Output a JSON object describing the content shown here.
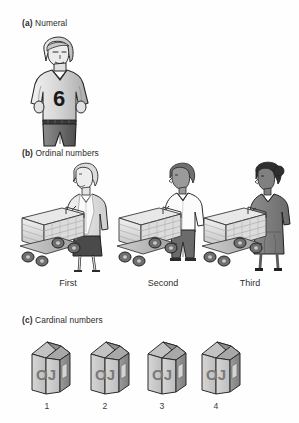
{
  "figure": {
    "background_color": "#ffffff",
    "ink_color": "#231f20"
  },
  "panels": [
    {
      "tag": "(a)",
      "label": "Numeral",
      "illustration": "soccer-player-wearing-numbered-jersey",
      "jersey_number": "6"
    },
    {
      "tag": "(b)",
      "label": "Ordinal numbers",
      "illustration": "three-shoppers-pushing-flatbed-carts-in-a-line",
      "items": [
        {
          "caption": "First",
          "figure": "woman-with-short-light-hair-in-cardigan-and-dark-skirt"
        },
        {
          "caption": "Second",
          "figure": "man-in-white-shirt-and-dark-trousers"
        },
        {
          "caption": "Third",
          "figure": "woman-in-dark-dress-with-dark-hair"
        }
      ]
    },
    {
      "tag": "(c)",
      "label": "Cardinal numbers",
      "illustration": "four-orange-juice-cartons-in-a-row",
      "carton_text": "OJ",
      "items": [
        {
          "caption": "1"
        },
        {
          "caption": "2"
        },
        {
          "caption": "3"
        },
        {
          "caption": "4"
        }
      ]
    }
  ]
}
